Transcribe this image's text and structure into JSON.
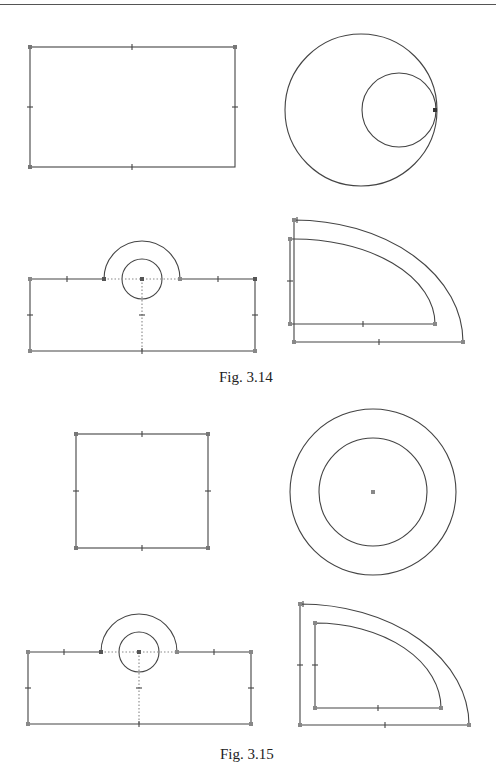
{
  "page": {
    "top_rule": true
  },
  "figures": [
    {
      "caption": "Fig. 3.14",
      "panels": [
        "rectangle",
        "tangent-circles",
        "slot-with-arc",
        "quarter-annulus"
      ]
    },
    {
      "caption": "Fig. 3.15",
      "panels": [
        "square",
        "concentric-circles",
        "slot-with-arc",
        "quarter-annulus-offset"
      ]
    }
  ],
  "colors": {
    "stroke": "#444444",
    "vertex": "#777777",
    "dotted": "#888888"
  }
}
